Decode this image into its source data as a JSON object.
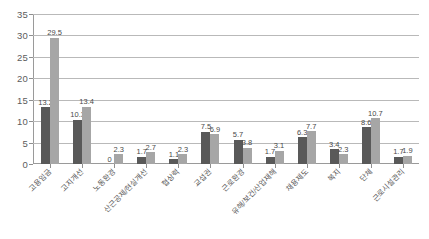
{
  "chart_data": {
    "type": "bar",
    "title": "",
    "subtitle": "",
    "xlabel": "",
    "ylabel": "",
    "ylim": [
      0,
      35
    ],
    "ytick_step": 5,
    "yticks": [
      "0",
      "5",
      "10",
      "15",
      "20",
      "25",
      "30",
      "35"
    ],
    "grid": true,
    "legend": "none",
    "orientation": "vertical",
    "grouping": "clustered",
    "categories": [
      "고용임금",
      "고지개선",
      "노동환경",
      "산근공제/현실개선",
      "협상력",
      "교섭권",
      "근로환경",
      "유해/보건/산업재해",
      "채용제도",
      "복지",
      "단체",
      "근로시설관리"
    ],
    "series": [
      {
        "name": "series-1",
        "color": "#595959",
        "values": [
          13.2,
          10.3,
          0,
          1.7,
          1.1,
          7.5,
          5.7,
          1.7,
          6.3,
          3.4,
          8.6,
          1.7
        ]
      },
      {
        "name": "series-2",
        "color": "#a6a6a6",
        "values": [
          29.5,
          13.4,
          2.3,
          2.7,
          2.3,
          6.9,
          3.8,
          3.1,
          7.7,
          2.3,
          10.7,
          1.9
        ]
      }
    ],
    "data_labels": [
      [
        "13.2",
        "29.5"
      ],
      [
        "10.3",
        "13.4"
      ],
      [
        "0",
        "2.3"
      ],
      [
        "1.7",
        "2.7"
      ],
      [
        "1.1",
        "2.3"
      ],
      [
        "7.5",
        "6.9"
      ],
      [
        "5.7",
        "3.8"
      ],
      [
        "1.7",
        "3.1"
      ],
      [
        "6.3",
        "7.7"
      ],
      [
        "3.4",
        "2.3"
      ],
      [
        "8.6",
        "10.7"
      ],
      [
        "1.7",
        "1.9"
      ]
    ],
    "colors": {
      "series_1": "#595959",
      "series_2": "#a6a6a6",
      "gridline": "#b9b9b9",
      "axis": "#9a9a9a",
      "tick_text": "#5c5c5c",
      "label_text": "#4a4a4a",
      "background": "#ffffff"
    }
  }
}
